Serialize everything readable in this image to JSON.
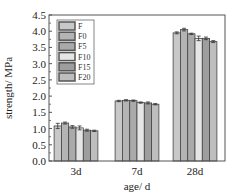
{
  "chart_data": {
    "type": "bar",
    "title": "",
    "xlabel": "age/ d",
    "ylabel": "strength/ MPa",
    "ylim": [
      0,
      4.5
    ],
    "yticks": [
      "0.0",
      "0.5",
      "1.0",
      "1.5",
      "2.0",
      "2.5",
      "3.0",
      "3.5",
      "4.0",
      "4.5"
    ],
    "categories": [
      "3d",
      "7d",
      "28d"
    ],
    "legend_position": "top-left",
    "series": [
      {
        "name": "F",
        "color": "#c8c8c8",
        "values": [
          1.08,
          1.85,
          3.95
        ],
        "errors": [
          0.08,
          0.02,
          0.03
        ]
      },
      {
        "name": "F0",
        "color": "#b4b4b4",
        "values": [
          1.17,
          1.87,
          4.05
        ],
        "errors": [
          0.03,
          0.02,
          0.04
        ]
      },
      {
        "name": "F5",
        "color": "#aaaaaa",
        "values": [
          1.05,
          1.86,
          3.92
        ],
        "errors": [
          0.04,
          0.02,
          0.02
        ]
      },
      {
        "name": "F10",
        "color": "#e6e6e6",
        "values": [
          1.02,
          1.8,
          3.78
        ],
        "errors": [
          0.06,
          0.02,
          0.07
        ]
      },
      {
        "name": "F15",
        "color": "#9e9e9e",
        "values": [
          0.95,
          1.79,
          3.78
        ],
        "errors": [
          0.03,
          0.03,
          0.04
        ]
      },
      {
        "name": "F20",
        "color": "#bebebe",
        "values": [
          0.93,
          1.75,
          3.68
        ],
        "errors": [
          0.02,
          0.02,
          0.03
        ]
      }
    ]
  }
}
